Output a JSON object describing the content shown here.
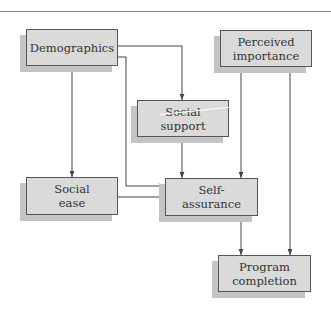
{
  "diagram": {
    "type": "path-model",
    "colors": {
      "box_fill": "#dadada",
      "box_border": "#555555",
      "shadow": "#c4c4c4",
      "edge": "#444444",
      "text": "#333333",
      "rule": "#8a8a8a"
    },
    "nodes": [
      {
        "id": "demographics",
        "label": "Demographics",
        "x": 26,
        "y": 29,
        "w": 92,
        "h": 37
      },
      {
        "id": "perceived_importance",
        "label": "Perceived\nimportance",
        "x": 220,
        "y": 30,
        "w": 92,
        "h": 37
      },
      {
        "id": "social_support",
        "label": "Social\nsupport",
        "x": 137,
        "y": 100,
        "w": 92,
        "h": 37
      },
      {
        "id": "social_ease",
        "label": "Social\nease",
        "x": 26,
        "y": 177,
        "w": 92,
        "h": 38
      },
      {
        "id": "self_assurance",
        "label": "Self-\nassurance",
        "x": 165,
        "y": 178,
        "w": 93,
        "h": 38
      },
      {
        "id": "program_completion",
        "label": "Program\ncompletion",
        "x": 218,
        "y": 255,
        "w": 93,
        "h": 37
      }
    ],
    "edges": [
      {
        "from": "demographics",
        "to": "social_support",
        "points": [
          [
            118,
            46
          ],
          [
            182,
            46
          ],
          [
            182,
            100
          ]
        ]
      },
      {
        "from": "demographics",
        "to": "self_assurance",
        "points": [
          [
            118,
            57
          ],
          [
            126,
            57
          ],
          [
            126,
            186
          ],
          [
            165,
            186
          ]
        ]
      },
      {
        "from": "demographics",
        "to": "social_ease",
        "points": [
          [
            72,
            66
          ],
          [
            72,
            177
          ]
        ]
      },
      {
        "from": "social_support",
        "to": "self_assurance",
        "points": [
          [
            182,
            137
          ],
          [
            182,
            178
          ]
        ]
      },
      {
        "from": "social_ease",
        "to": "self_assurance",
        "points": [
          [
            118,
            197
          ],
          [
            165,
            197
          ]
        ]
      },
      {
        "from": "perceived_importance",
        "to": "self_assurance",
        "points": [
          [
            241,
            67
          ],
          [
            241,
            178
          ]
        ]
      },
      {
        "from": "perceived_importance",
        "to": "program_completion",
        "points": [
          [
            290,
            67
          ],
          [
            290,
            255
          ]
        ]
      },
      {
        "from": "self_assurance",
        "to": "program_completion",
        "points": [
          [
            241,
            216
          ],
          [
            241,
            255
          ]
        ]
      }
    ]
  }
}
